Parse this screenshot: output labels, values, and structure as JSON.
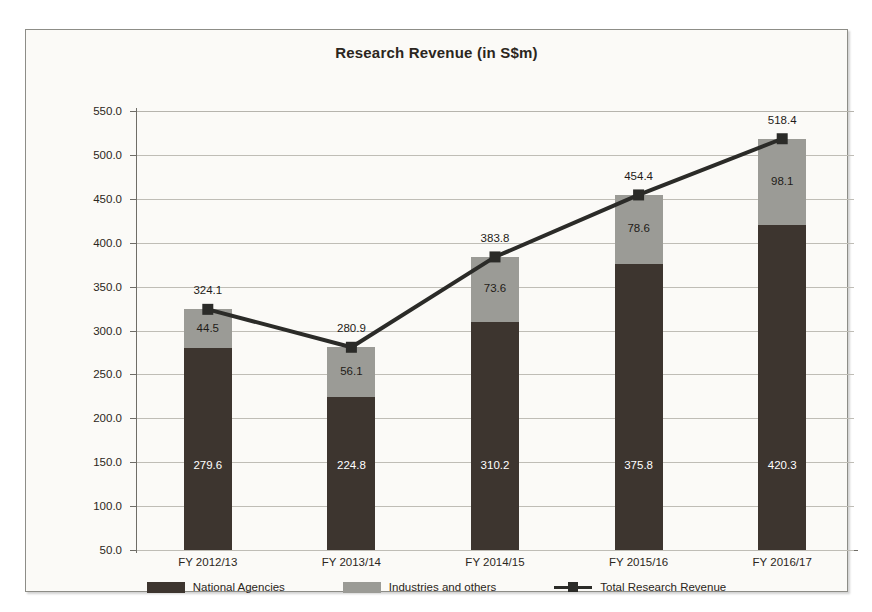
{
  "chart_data": {
    "type": "bar",
    "subtype": "stacked-bar-with-line",
    "title": "Research Revenue (in S$m)",
    "xlabel": "",
    "ylabel": "",
    "ylim": [
      50.0,
      550.0
    ],
    "ytick_step": 50.0,
    "ytick_labels": [
      "550.0",
      "500.0",
      "450.0",
      "400.0",
      "350.0",
      "300.0",
      "250.0",
      "200.0",
      "150.0",
      "100.0",
      "50.0"
    ],
    "ytick_values": [
      550.0,
      500.0,
      450.0,
      400.0,
      350.0,
      300.0,
      250.0,
      200.0,
      150.0,
      100.0,
      50.0
    ],
    "grid": true,
    "legend_position": "bottom",
    "categories": [
      "FY 2012/13",
      "FY 2013/14",
      "FY 2014/15",
      "FY 2015/16",
      "FY 2016/17"
    ],
    "series": [
      {
        "name": "National Agencies",
        "type": "bar",
        "color": "#3d352f",
        "values": [
          279.6,
          224.8,
          310.2,
          375.8,
          420.3
        ],
        "labels": [
          "279.6",
          "224.8",
          "310.2",
          "375.8",
          "420.3"
        ]
      },
      {
        "name": "Industries and others",
        "type": "bar",
        "color": "#9b9b96",
        "values": [
          44.5,
          56.1,
          73.6,
          78.6,
          98.1
        ],
        "labels": [
          "44.5",
          "56.1",
          "73.6",
          "78.6",
          "98.1"
        ]
      },
      {
        "name": "Total Research Revenue",
        "type": "line",
        "color": "#2b2b28",
        "marker": "square",
        "values": [
          324.1,
          280.9,
          383.8,
          454.4,
          518.4
        ],
        "labels": [
          "324.1",
          "280.9",
          "383.8",
          "454.4",
          "518.4"
        ]
      }
    ]
  },
  "legend": {
    "items": [
      {
        "label": "National Agencies",
        "swatch": "dark"
      },
      {
        "label": "Industries and others",
        "swatch": "gray"
      },
      {
        "label": "Total Research Revenue",
        "swatch": "line"
      }
    ]
  },
  "colors": {
    "national_agencies": "#3d352f",
    "industries_and_others": "#9b9b96",
    "total_line": "#2b2b28",
    "background": "#fbfaf7",
    "gridline": "#bfbdb6",
    "axis": "#6f6d67"
  }
}
